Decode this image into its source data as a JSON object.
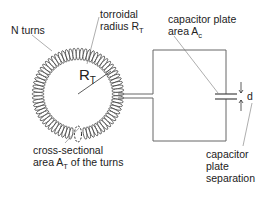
{
  "diagram": {
    "labels": {
      "n_turns": "N turns",
      "toroid_radius_line1": "torroidal",
      "toroid_radius_line2": "radius R",
      "toroid_radius_sub": "T",
      "rt_main": "R",
      "rt_sub": "T",
      "cap_area_line1": "capacitor plate",
      "cap_area_line2": "area A",
      "cap_area_sub": "c",
      "d": "d",
      "cross_line1": "cross-sectional",
      "cross_line2_pre": "area A",
      "cross_sub": "T",
      "cross_line2_post": " of the turns",
      "sep_line1": "capacitor",
      "sep_line2": "plate",
      "sep_line3": "separation"
    },
    "toroid": {
      "cx": 78,
      "cy": 94,
      "outer_r": 46,
      "inner_r": 34,
      "turn_count": 72
    },
    "colors": {
      "line": "#555555",
      "coil": "#333333",
      "text": "#222222"
    }
  }
}
